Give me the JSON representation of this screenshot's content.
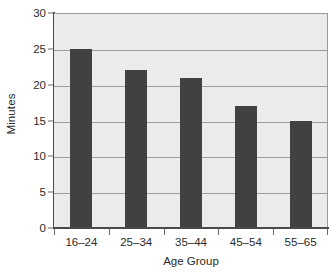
{
  "chart_data": {
    "type": "bar",
    "title": "",
    "subtitle": "",
    "categories": [
      "16–24",
      "25–34",
      "35–44",
      "45–54",
      "55–65"
    ],
    "values": [
      25,
      22,
      21,
      17,
      15
    ],
    "xlabel": "Age Group",
    "ylabel": "Minutes",
    "ylim": [
      0,
      30
    ],
    "yticks": [
      0,
      5,
      10,
      15,
      20,
      25,
      30
    ],
    "ytick_labels": [
      "0",
      "5",
      "10",
      "15",
      "20",
      "25",
      "30"
    ],
    "grid": true,
    "grid_axis": "y",
    "legend": false,
    "legend_position": "none",
    "bar_color": "#414141",
    "plot_background": "#ebebeb",
    "figure_background": "#ffffff",
    "gridline_color": "#9d9d9d",
    "axis_color": "#4a4a4a",
    "text_color": "#2b2b2b"
  }
}
